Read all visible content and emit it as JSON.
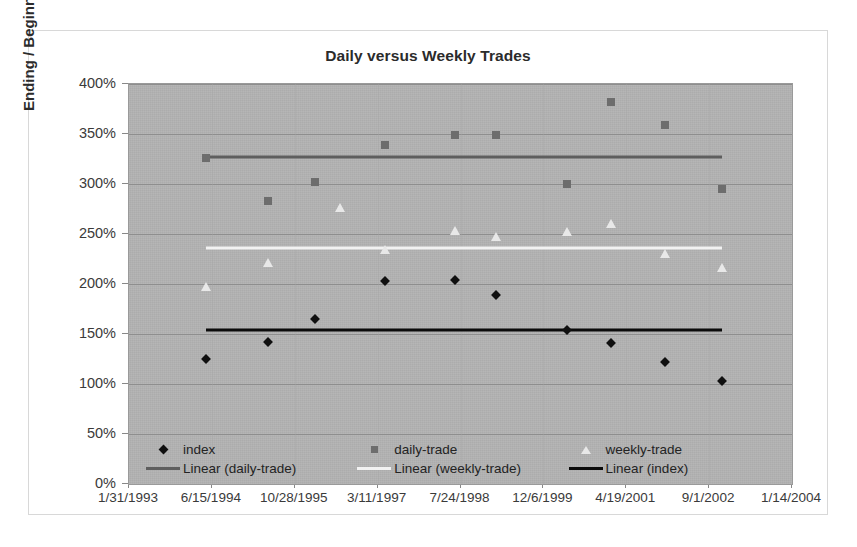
{
  "chart_data": {
    "type": "scatter",
    "title": "Daily versus Weekly Trades",
    "xlabel": "",
    "ylabel": "Ending / Beginning Value",
    "grid": true,
    "legend_position": "inside-bottom",
    "ylim": [
      0,
      400
    ],
    "ytick_labels": [
      "400%",
      "350%",
      "300%",
      "250%",
      "200%",
      "150%",
      "100%",
      "50%",
      "0%"
    ],
    "ytick_values": [
      400,
      350,
      300,
      250,
      200,
      150,
      100,
      50,
      0
    ],
    "xtick_labels": [
      "1/31/1993",
      "6/15/1994",
      "10/28/1995",
      "3/11/1997",
      "7/24/1998",
      "12/6/1999",
      "4/19/2001",
      "9/1/2002",
      "1/14/2004"
    ],
    "xtick_positions": [
      0,
      1,
      2,
      3,
      4,
      5,
      6,
      7,
      8
    ],
    "xlim": [
      0,
      8
    ],
    "series": [
      {
        "name": "index",
        "marker": "diamond",
        "color": "#101010",
        "points": [
          {
            "x": 0.93,
            "y": 125
          },
          {
            "x": 1.68,
            "y": 142
          },
          {
            "x": 2.24,
            "y": 165
          },
          {
            "x": 3.09,
            "y": 203
          },
          {
            "x": 3.93,
            "y": 204
          },
          {
            "x": 4.43,
            "y": 189
          },
          {
            "x": 5.28,
            "y": 154
          },
          {
            "x": 5.81,
            "y": 141
          },
          {
            "x": 6.47,
            "y": 122
          },
          {
            "x": 7.15,
            "y": 103
          }
        ]
      },
      {
        "name": "daily-trade",
        "marker": "square",
        "color": "#6d6d6d",
        "points": [
          {
            "x": 0.93,
            "y": 326
          },
          {
            "x": 1.68,
            "y": 283
          },
          {
            "x": 2.24,
            "y": 302
          },
          {
            "x": 3.09,
            "y": 339
          },
          {
            "x": 3.93,
            "y": 349
          },
          {
            "x": 4.43,
            "y": 349
          },
          {
            "x": 5.28,
            "y": 300
          },
          {
            "x": 5.81,
            "y": 382
          },
          {
            "x": 6.47,
            "y": 359
          },
          {
            "x": 7.15,
            "y": 295
          }
        ]
      },
      {
        "name": "weekly-trade",
        "marker": "triangle",
        "color": "#e8e8e8",
        "points": [
          {
            "x": 0.93,
            "y": 197
          },
          {
            "x": 1.68,
            "y": 221
          },
          {
            "x": 2.55,
            "y": 276
          },
          {
            "x": 3.09,
            "y": 234
          },
          {
            "x": 3.93,
            "y": 253
          },
          {
            "x": 4.43,
            "y": 247
          },
          {
            "x": 5.28,
            "y": 252
          },
          {
            "x": 5.81,
            "y": 260
          },
          {
            "x": 6.47,
            "y": 230
          },
          {
            "x": 7.15,
            "y": 216
          }
        ]
      }
    ],
    "trendlines": [
      {
        "name": "Linear (daily-trade)",
        "color": "#5e5e5e",
        "x0": 0.93,
        "x1": 7.15,
        "y0": 326,
        "y1": 329
      },
      {
        "name": "Linear (weekly-trade)",
        "color": "#f2f2f2",
        "x0": 0.93,
        "x1": 7.15,
        "y0": 234,
        "y1": 238
      },
      {
        "name": "Linear (index)",
        "color": "#0b0b0b",
        "x0": 0.93,
        "x1": 7.15,
        "y0": 153,
        "y1": 156
      }
    ],
    "legend": [
      {
        "label": "index",
        "key": "diamond-marker",
        "color": "#101010"
      },
      {
        "label": "daily-trade",
        "key": "square-marker",
        "color": "#6d6d6d"
      },
      {
        "label": "weekly-trade",
        "key": "triangle-marker",
        "color": "#e8e8e8"
      },
      {
        "label": "Linear (daily-trade)",
        "key": "line-key",
        "color": "#5e5e5e"
      },
      {
        "label": "Linear (weekly-trade)",
        "key": "line-key",
        "color": "#f2f2f2"
      },
      {
        "label": "Linear (index)",
        "key": "line-key",
        "color": "#0b0b0b"
      }
    ],
    "plot_background": "#b3b3b3",
    "figure_background": "#ffffff"
  }
}
